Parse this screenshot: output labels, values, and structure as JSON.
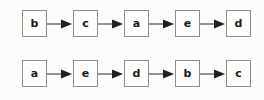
{
  "diagram": {
    "type": "linked-list-chains",
    "background_color": "#fcfcfb",
    "node_border_color": "#8e8e8e",
    "node_fill_color": "#fdfdfc",
    "label_color": "#1b1b1b",
    "arrow_color": "#2b2b2b",
    "arrow_icon_name": "arrow-right-icon",
    "rows": [
      {
        "row_index": 0,
        "nodes": [
          {
            "label": "b"
          },
          {
            "label": "c"
          },
          {
            "label": "a"
          },
          {
            "label": "e"
          },
          {
            "label": "d"
          }
        ]
      },
      {
        "row_index": 1,
        "nodes": [
          {
            "label": "a"
          },
          {
            "label": "e"
          },
          {
            "label": "d"
          },
          {
            "label": "b"
          },
          {
            "label": "c"
          }
        ]
      }
    ]
  }
}
